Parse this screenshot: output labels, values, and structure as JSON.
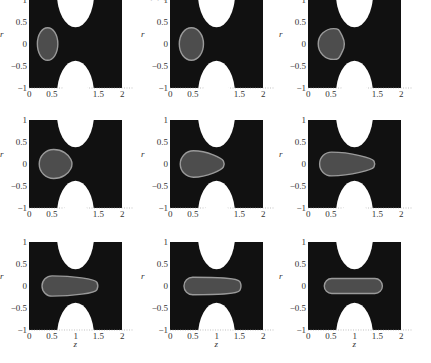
{
  "figure": {
    "top_caption_fragment": "· · · · · · · · · · · · ·",
    "layout": {
      "rows": 3,
      "cols": 3
    },
    "colors": {
      "background": "#ffffff",
      "continuous_phase": "#111111",
      "droplet_fill": "#4d4d4d",
      "droplet_outline": "#9a9a9a",
      "constriction_wall": "#ffffff",
      "text": "#333333"
    },
    "axes": {
      "xlabel": "z",
      "ylabel": "r",
      "xticks": [
        "0",
        "0.5",
        "1",
        "1.5",
        "2"
      ],
      "yticks": [
        "1",
        "0.5",
        "0",
        "−0.5",
        "−1"
      ],
      "xlim": [
        0,
        2
      ],
      "ylim": [
        -1,
        1
      ]
    },
    "constriction": {
      "description": "two elliptical wall obstacles centred at z=1 (top and bottom)",
      "center_z": 1.0,
      "half_width_z": 0.4,
      "gap_half_height_r": 0.38
    },
    "panels": [
      {
        "label_prefix": "T",
        "label_value": "=0.1",
        "t": 0.1,
        "droplet": {
          "shape": "ellipse",
          "z_left": 0.18,
          "z_right": 0.62,
          "r_half": 0.37,
          "tip": 0.0
        }
      },
      {
        "label_prefix": "T",
        "label_value": "=0.3",
        "t": 0.3,
        "droplet": {
          "shape": "ellipse",
          "z_left": 0.2,
          "z_right": 0.72,
          "r_half": 0.37,
          "tip": 0.05
        }
      },
      {
        "label_prefix": "T",
        "label_value": "=0.5",
        "t": 0.5,
        "droplet": {
          "shape": "drop",
          "z_left": 0.22,
          "z_right": 0.82,
          "r_half": 0.35,
          "tip": 0.3
        }
      },
      {
        "label_prefix": "T",
        "label_value": "=0.7",
        "t": 0.7,
        "droplet": {
          "shape": "drop",
          "z_left": 0.22,
          "z_right": 0.95,
          "r_half": 0.33,
          "tip": 0.6
        }
      },
      {
        "label_prefix": "T",
        "label_value": "=1",
        "t": 1,
        "droplet": {
          "shape": "drop",
          "z_left": 0.22,
          "z_right": 1.18,
          "r_half": 0.3,
          "tip": 0.85
        }
      },
      {
        "label_prefix": "T",
        "label_value": "=1.5",
        "t": 1.5,
        "droplet": {
          "shape": "drop",
          "z_left": 0.25,
          "z_right": 1.45,
          "r_half": 0.27,
          "tip": 0.8
        }
      },
      {
        "label_prefix": "T",
        "label_value": "=2",
        "t": 2,
        "droplet": {
          "shape": "drop",
          "z_left": 0.28,
          "z_right": 1.5,
          "r_half": 0.23,
          "tip": 0.55
        }
      },
      {
        "label_prefix": "T",
        "label_value": "=3",
        "t": 3,
        "droplet": {
          "shape": "drop",
          "z_left": 0.3,
          "z_right": 1.55,
          "r_half": 0.2,
          "tip": 0.25
        }
      },
      {
        "label_prefix": "T",
        "label_value": "=4",
        "t": 4,
        "droplet": {
          "shape": "capsule",
          "z_left": 0.35,
          "z_right": 1.6,
          "r_half": 0.17,
          "tip": 0.0
        }
      }
    ]
  }
}
